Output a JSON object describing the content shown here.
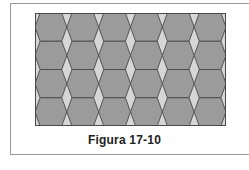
{
  "figure": {
    "caption": "Figura 17-10",
    "grid": {
      "columns": 6,
      "rows": 4
    },
    "colors": {
      "hexagon_fill": "#9b9b9b",
      "rhombus_fill": "#d6d6d6",
      "stroke": "#4a4a4a",
      "frame_border": "#9a9a9a"
    }
  }
}
